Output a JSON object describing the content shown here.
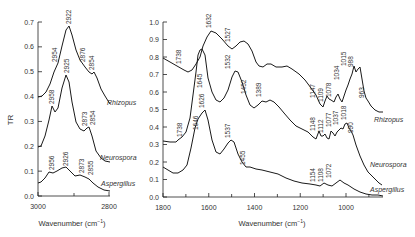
{
  "chart_data": [
    {
      "type": "line",
      "title": "",
      "xlabel": "Wavenumber (cm⁻¹)",
      "ylabel": "TR",
      "xlim": [
        3000,
        2800
      ],
      "ylim": [
        0.0,
        0.7
      ],
      "yticks": [
        "0.0",
        "0.1",
        "0.2",
        "0.3",
        "0.4",
        "0.5",
        "0.6",
        "0.7"
      ],
      "xticks": [
        "3000",
        "2800"
      ],
      "grid": false,
      "series": [
        {
          "name": "Rhizopus",
          "x": [
            3000,
            2985,
            2970,
            2954,
            2940,
            2922,
            2905,
            2890,
            2876,
            2865,
            2854,
            2840,
            2820,
            2805
          ],
          "y": [
            0.4,
            0.42,
            0.47,
            0.53,
            0.6,
            0.68,
            0.6,
            0.54,
            0.51,
            0.49,
            0.49,
            0.44,
            0.38,
            0.34
          ],
          "peak_labels": [
            "2954",
            "2922",
            "2876",
            "2854"
          ]
        },
        {
          "name": "Neurospora",
          "x": [
            3000,
            2990,
            2975,
            2958,
            2945,
            2925,
            2910,
            2890,
            2873,
            2862,
            2854,
            2840,
            2820,
            2805
          ],
          "y": [
            0.2,
            0.21,
            0.27,
            0.36,
            0.35,
            0.47,
            0.38,
            0.29,
            0.28,
            0.27,
            0.28,
            0.22,
            0.17,
            0.14
          ],
          "peak_labels": [
            "2958",
            "2925",
            "2873",
            "2854"
          ]
        },
        {
          "name": "Aspergillus",
          "x": [
            3000,
            2985,
            2970,
            2956,
            2945,
            2926,
            2910,
            2890,
            2873,
            2862,
            2855,
            2840,
            2820,
            2805
          ],
          "y": [
            0.04,
            0.05,
            0.07,
            0.09,
            0.09,
            0.11,
            0.09,
            0.075,
            0.07,
            0.07,
            0.065,
            0.05,
            0.035,
            0.03
          ],
          "peak_labels": [
            "2956",
            "2926",
            "2873",
            "2855"
          ]
        }
      ]
    },
    {
      "type": "line",
      "title": "",
      "xlabel": "Wavenumber (cm⁻¹)",
      "ylabel": "",
      "xlim": [
        1800,
        860
      ],
      "ylim": [
        0.0,
        1.0
      ],
      "yticks": [
        "0.0",
        "0.1",
        "0.2",
        "0.3",
        "0.4",
        "0.5",
        "0.6",
        "0.7",
        "0.8",
        "0.9",
        "1.0"
      ],
      "xticks": [
        "1800",
        "1600",
        "1400",
        "1200",
        "1000"
      ],
      "grid": false,
      "series": [
        {
          "name": "Rhizopus",
          "x": [
            1800,
            1770,
            1738,
            1710,
            1680,
            1660,
            1645,
            1632,
            1610,
            1580,
            1560,
            1527,
            1500,
            1480,
            1452,
            1420,
            1389,
            1360,
            1330,
            1300,
            1260,
            1220,
            1190,
            1170,
            1147,
            1130,
            1109,
            1095,
            1078,
            1060,
            1034,
            1015,
            1005,
            988,
            975,
            963,
            940,
            920,
            900,
            880
          ],
          "y": [
            0.8,
            0.77,
            0.75,
            0.72,
            0.76,
            0.84,
            0.9,
            0.96,
            0.93,
            0.86,
            0.87,
            0.91,
            0.83,
            0.75,
            0.76,
            0.76,
            0.77,
            0.74,
            0.7,
            0.66,
            0.6,
            0.55,
            0.47,
            0.42,
            0.49,
            0.45,
            0.46,
            0.42,
            0.47,
            0.53,
            0.57,
            0.63,
            0.6,
            0.62,
            0.55,
            0.45,
            0.43,
            0.4,
            0.37,
            0.36
          ],
          "peak_labels": [
            "1738",
            "1632",
            "1645",
            "1527",
            "1452",
            "1389",
            "1147",
            "1109",
            "1078",
            "1034",
            "1015",
            "988",
            "963"
          ]
        },
        {
          "name": "Neurospora",
          "x": [
            1800,
            1770,
            1738,
            1710,
            1680,
            1660,
            1646,
            1626,
            1610,
            1580,
            1560,
            1532,
            1510,
            1480,
            1460,
            1440,
            1420,
            1389,
            1360,
            1330,
            1300,
            1260,
            1220,
            1190,
            1170,
            1148,
            1130,
            1112,
            1095,
            1077,
            1060,
            1037,
            1018,
            1005,
            990,
            975,
            950,
            920,
            900,
            880
          ],
          "y": [
            0.32,
            0.31,
            0.33,
            0.35,
            0.5,
            0.7,
            0.86,
            0.86,
            0.7,
            0.56,
            0.6,
            0.74,
            0.7,
            0.57,
            0.54,
            0.56,
            0.55,
            0.56,
            0.52,
            0.48,
            0.44,
            0.4,
            0.36,
            0.33,
            0.31,
            0.35,
            0.32,
            0.33,
            0.31,
            0.35,
            0.33,
            0.36,
            0.38,
            0.34,
            0.33,
            0.3,
            0.22,
            0.16,
            0.13,
            0.12
          ],
          "peak_labels": [
            "1738",
            "1646",
            "1626",
            "1532",
            "1148",
            "1112",
            "1077",
            "1037",
            "1018",
            "990"
          ]
        },
        {
          "name": "Aspergillus",
          "x": [
            1800,
            1770,
            1740,
            1710,
            1680,
            1660,
            1646,
            1626,
            1610,
            1580,
            1560,
            1537,
            1510,
            1480,
            1455,
            1420,
            1389,
            1360,
            1330,
            1300,
            1260,
            1220,
            1190,
            1170,
            1154,
            1130,
            1108,
            1090,
            1072,
            1050,
            1020,
            1000,
            980,
            950,
            920,
            900,
            880
          ],
          "y": [
            0.17,
            0.15,
            0.14,
            0.16,
            0.25,
            0.4,
            0.48,
            0.52,
            0.35,
            0.26,
            0.28,
            0.33,
            0.28,
            0.19,
            0.18,
            0.16,
            0.15,
            0.14,
            0.13,
            0.11,
            0.1,
            0.09,
            0.08,
            0.07,
            0.07,
            0.06,
            0.06,
            0.07,
            0.08,
            0.06,
            0.04,
            0.03,
            0.02,
            0.015,
            0.01,
            0.01,
            0.01
          ],
          "peak_labels": [
            "1646",
            "1626",
            "1537",
            "1455",
            "1154",
            "1108",
            "1072"
          ]
        }
      ]
    }
  ],
  "panels": {
    "left": {
      "ylabel": "TR",
      "xlabel": "Wavenumber (cm",
      "xlabel_sup": "−1",
      "xlabel_close": ")",
      "yticks": [
        "0.0",
        "0.1",
        "0.2",
        "0.3",
        "0.4",
        "0.5",
        "0.6",
        "0.7"
      ],
      "xticks": [
        "3000",
        "2800"
      ],
      "series_labels": [
        "Rhizopus",
        "Neurospora",
        "Aspergillus"
      ],
      "peaks": {
        "rhizopus": [
          "2954",
          "2922",
          "2876",
          "2854"
        ],
        "neurospora": [
          "2958",
          "2925",
          "2873",
          "2854"
        ],
        "aspergillus": [
          "2956",
          "2926",
          "2873",
          "2855"
        ]
      }
    },
    "right": {
      "xlabel": "Wavenumber (cm",
      "xlabel_sup": "−1",
      "xlabel_close": ")",
      "yticks": [
        "0.0",
        "0.1",
        "0.2",
        "0.3",
        "0.4",
        "0.5",
        "0.6",
        "0.7",
        "0.8",
        "0.9",
        "1.0"
      ],
      "xticks": [
        "1800",
        "1600",
        "1400",
        "1200",
        "1000"
      ],
      "series_labels": [
        "Rhizopus",
        "Neurospora",
        "Aspergillus"
      ],
      "peaks": {
        "rhizopus": [
          "1738",
          "1632",
          "1645",
          "1527",
          "1452",
          "1389",
          "1147",
          "1109",
          "1078",
          "1034",
          "1015",
          "988",
          "963"
        ],
        "neurospora": [
          "1738",
          "1646",
          "1532",
          "1148",
          "1112",
          "1077",
          "1037",
          "1018",
          "990"
        ],
        "aspergillus": [
          "1626",
          "1537",
          "1455",
          "1154",
          "1108",
          "1072"
        ]
      }
    }
  },
  "colors": {
    "line": "#1a1a1a",
    "text": "#333333",
    "background": "#ffffff"
  }
}
